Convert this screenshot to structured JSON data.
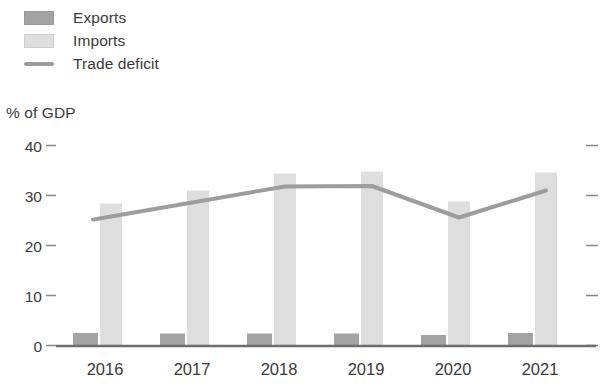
{
  "legend": {
    "items": [
      {
        "label": "Exports",
        "marker": "square",
        "color": "#a3a3a3"
      },
      {
        "label": "Imports",
        "marker": "square",
        "color": "#dedede"
      },
      {
        "label": "Trade deficit",
        "marker": "line",
        "color": "#9d9d9d"
      }
    ]
  },
  "axis": {
    "y_title": "% of GDP",
    "y_ticks": [
      "0",
      "10",
      "20",
      "30",
      "40"
    ],
    "x_ticks": [
      "2016",
      "2017",
      "2018",
      "2019",
      "2020",
      "2021"
    ]
  },
  "chart_data": {
    "type": "bar",
    "title": "",
    "subtitle": "",
    "xlabel": "",
    "ylabel": "% of GDP",
    "ylim": [
      0,
      40
    ],
    "ytick_values": [
      0,
      10,
      20,
      30,
      40
    ],
    "grid": false,
    "legend_position": "top-left",
    "categories": [
      "2016",
      "2017",
      "2018",
      "2019",
      "2020",
      "2021"
    ],
    "series": [
      {
        "name": "Exports",
        "type": "bar",
        "color": "#a3a3a3",
        "values": [
          2.5,
          2.4,
          2.4,
          2.4,
          2.1,
          2.5
        ]
      },
      {
        "name": "Imports",
        "type": "bar",
        "color": "#dedede",
        "values": [
          28.4,
          31.0,
          34.4,
          34.8,
          28.8,
          34.6
        ]
      },
      {
        "name": "Trade deficit",
        "type": "line",
        "color": "#9d9d9d",
        "values": [
          25.8,
          28.8,
          31.8,
          31.9,
          25.6,
          31.0
        ]
      }
    ]
  }
}
